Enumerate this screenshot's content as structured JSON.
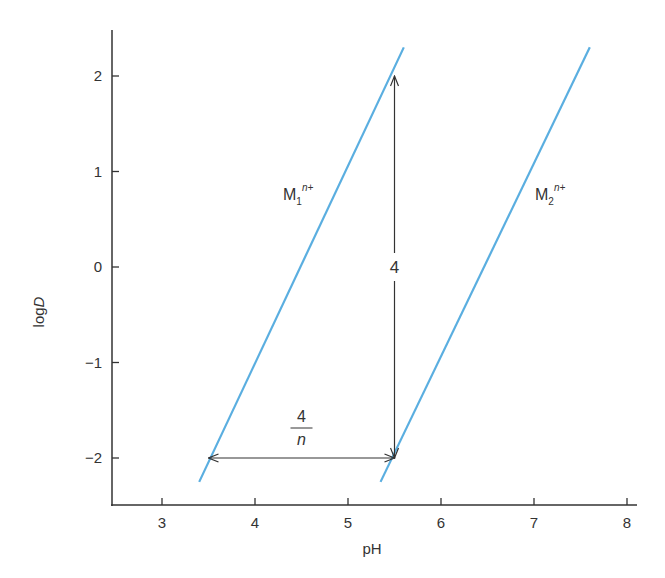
{
  "chart_data": {
    "type": "line",
    "title": "",
    "xlabel": "pH",
    "ylabel": "logD",
    "ylabel_parts": {
      "normal": "log",
      "italic": "D"
    },
    "xlim": [
      2.45,
      8.4
    ],
    "ylim": [
      -2.5,
      2.45
    ],
    "x_ticks": [
      3,
      4,
      5,
      6,
      7,
      8
    ],
    "x_tick_labels": [
      "3",
      "4",
      "5",
      "6",
      "7",
      "8"
    ],
    "y_ticks": [
      2,
      1,
      0,
      -1,
      -2
    ],
    "y_tick_labels": [
      "2",
      "1",
      "0",
      "−1",
      "−2"
    ],
    "grid": false,
    "legend": "none (inline labels)",
    "line_color": "#5aaee0",
    "series": [
      {
        "name": "M1^n+",
        "label_main": "M",
        "label_sub": "1",
        "label_sup": "n+",
        "x": [
          3.4,
          5.6
        ],
        "y": [
          -2.25,
          2.3
        ],
        "slope": 2
      },
      {
        "name": "M2^n+",
        "label_main": "M",
        "label_sub": "2",
        "label_sup": "n+",
        "x": [
          5.35,
          7.6
        ],
        "y": [
          -2.25,
          2.3
        ],
        "slope": 2
      }
    ],
    "annotations": [
      {
        "type": "vertical-double-arrow",
        "x": 5.5,
        "y_from": -2,
        "y_to": 2,
        "label": "4"
      },
      {
        "type": "horizontal-double-arrow",
        "y": -2,
        "x_from": 3.5,
        "x_to": 5.5,
        "label_numerator": "4",
        "label_denominator": "n"
      }
    ]
  }
}
